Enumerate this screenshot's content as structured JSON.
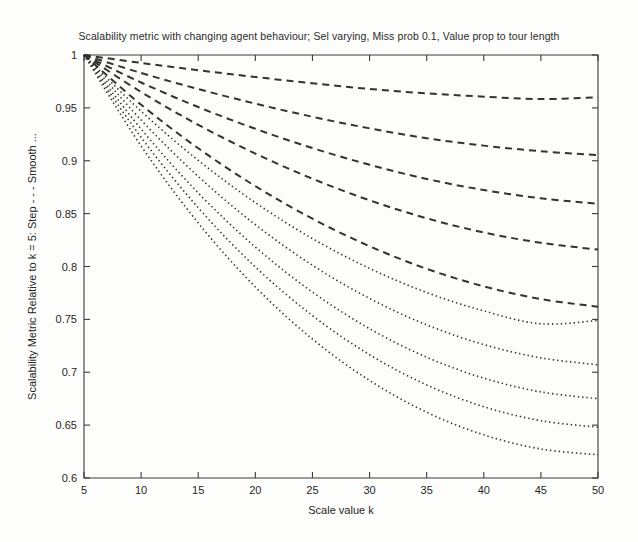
{
  "figure": {
    "title": "Scalability metric with changing agent behaviour; Sel varying, Miss prob 0.1, Value prop to tour length",
    "background_color": "#fdfdfc",
    "curve_color": "#333333",
    "axis_color": "#3a3a3a"
  },
  "chart_data": {
    "type": "line",
    "title": "Scalability metric with changing agent behaviour; Sel varying, Miss prob 0.1, Value prop to tour length",
    "xlabel": "Scale value k",
    "ylabel": "Scalability Metric Relative to k = 5: Step - - - Smooth ...",
    "xlim": [
      5,
      50
    ],
    "ylim": [
      0.6,
      1
    ],
    "xticks": [
      5,
      10,
      15,
      20,
      25,
      30,
      35,
      40,
      45,
      50
    ],
    "xticklabels": [
      "5",
      "10",
      "15",
      "20",
      "25",
      "30",
      "35",
      "40",
      "45",
      "50"
    ],
    "yticks": [
      0.6,
      0.65,
      0.7,
      0.75,
      0.8,
      0.85,
      0.9,
      0.95,
      1
    ],
    "yticklabels": [
      "0.6",
      "0.65",
      "0.7",
      "0.75",
      "0.8",
      "0.85",
      "0.9",
      "0.95",
      "1"
    ],
    "grid": false,
    "legend": "none",
    "legend_in_ylabel": true,
    "linestyles": {
      "step": "dashed",
      "smooth": "dotted"
    },
    "x": [
      5,
      10,
      15,
      20,
      25,
      30,
      35,
      40,
      45,
      50
    ],
    "series": [
      {
        "name": "Step 1",
        "style": "dashed",
        "values": [
          1,
          0.9925,
          0.9856,
          0.9792,
          0.9733,
          0.9679,
          0.9637,
          0.9606,
          0.9583,
          0.96
        ]
      },
      {
        "name": "Step 2",
        "style": "dashed",
        "values": [
          1,
          0.983,
          0.9678,
          0.954,
          0.9416,
          0.9306,
          0.9213,
          0.9143,
          0.909,
          0.9053
        ]
      },
      {
        "name": "Step 3",
        "style": "dashed",
        "values": [
          1,
          0.974,
          0.9508,
          0.9302,
          0.912,
          0.8962,
          0.8828,
          0.8723,
          0.8645,
          0.8593
        ]
      },
      {
        "name": "Step 4",
        "style": "dashed",
        "values": [
          1,
          0.965,
          0.934,
          0.9068,
          0.883,
          0.8626,
          0.8456,
          0.8322,
          0.8224,
          0.816
        ]
      },
      {
        "name": "Step 5",
        "style": "dashed",
        "values": [
          1,
          0.953,
          0.9118,
          0.876,
          0.8452,
          0.8192,
          0.7978,
          0.7812,
          0.7692,
          0.762
        ]
      },
      {
        "name": "Smooth 1",
        "style": "dotted",
        "values": [
          1,
          0.9468,
          0.9004,
          0.8604,
          0.8264,
          0.7982,
          0.7754,
          0.758,
          0.7458,
          0.749
        ]
      },
      {
        "name": "Smooth 2",
        "style": "dotted",
        "values": [
          1,
          0.9385,
          0.8852,
          0.8396,
          0.8012,
          0.7698,
          0.7448,
          0.7262,
          0.7136,
          0.707
        ]
      },
      {
        "name": "Smooth 3",
        "style": "dotted",
        "values": [
          1,
          0.93,
          0.8696,
          0.8184,
          0.7758,
          0.7412,
          0.7142,
          0.6944,
          0.6814,
          0.675
        ]
      },
      {
        "name": "Smooth 4",
        "style": "dotted",
        "values": [
          1,
          0.9222,
          0.8556,
          0.7996,
          0.7536,
          0.7166,
          0.688,
          0.6674,
          0.6542,
          0.648
        ]
      },
      {
        "name": "Smooth 5",
        "style": "dotted",
        "values": [
          1,
          0.914,
          0.8412,
          0.7806,
          0.7314,
          0.6922,
          0.6622,
          0.6408,
          0.6274,
          0.622
        ]
      }
    ]
  }
}
